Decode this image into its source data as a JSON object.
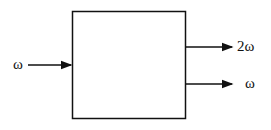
{
  "diagram": {
    "type": "block",
    "block": {
      "label": ""
    },
    "input": {
      "label": "ω"
    },
    "outputs": [
      {
        "label": "2ω"
      },
      {
        "label": "ω"
      }
    ],
    "colors": {
      "stroke": "#111111",
      "background": "#ffffff"
    }
  }
}
